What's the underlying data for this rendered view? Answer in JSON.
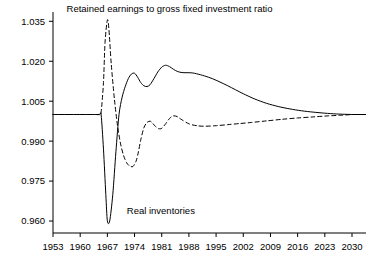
{
  "chart_data": {
    "type": "line",
    "title": "",
    "xlabel": "",
    "ylabel": "",
    "xlim": [
      1953,
      2030
    ],
    "ylim": [
      0.9555,
      1.0385
    ],
    "grid": false,
    "legend_position": "inline-annotation",
    "xticks": [
      "1953",
      "1960",
      "1967",
      "1974",
      "1981",
      "1988",
      "1995",
      "2002",
      "2009",
      "2016",
      "2023",
      "2030"
    ],
    "xtick_values": [
      1953,
      1960,
      1967,
      1974,
      1981,
      1988,
      1995,
      2002,
      2009,
      2016,
      2023,
      2030
    ],
    "yticks": [
      "0.960",
      "0.975",
      "0.990",
      "1.005",
      "1.020",
      "1.035"
    ],
    "ytick_values": [
      0.96,
      0.975,
      0.99,
      1.005,
      1.02,
      1.035
    ],
    "annotations": [
      {
        "name": "retained-earnings-label",
        "text": "Retained earnings to gross fixed investment ratio",
        "x": 1983,
        "y": 1.0385
      },
      {
        "name": "real-inventories-label",
        "text": "Real inventories",
        "x": 1972,
        "y": 0.9625
      }
    ],
    "series": [
      {
        "name": "Real inventories",
        "style": "solid",
        "color": "#000000",
        "x": [
          1953,
          1956,
          1959,
          1962,
          1964,
          1965,
          1965.4,
          1966,
          1966.6,
          1967,
          1967.6,
          1968.4,
          1969.2,
          1970,
          1970.8,
          1971.6,
          1972.4,
          1973.2,
          1974,
          1974.8,
          1975.6,
          1976.4,
          1977.2,
          1978,
          1979,
          1980,
          1981,
          1982,
          1983,
          1984,
          1985,
          1986,
          1987,
          1988,
          1989,
          1990,
          1992,
          1994,
          1996,
          1998,
          2000,
          2002,
          2005,
          2008,
          2011,
          2014,
          2017,
          2020,
          2023,
          2026,
          2030
        ],
        "y": [
          1.0,
          1.0,
          1.0,
          1.0,
          1.0,
          1.0,
          0.9998,
          0.987,
          0.97,
          0.9601,
          0.96,
          0.97,
          0.986,
          1.0,
          1.0065,
          1.0105,
          1.0135,
          1.0152,
          1.0155,
          1.014,
          1.012,
          1.0108,
          1.0105,
          1.0112,
          1.0135,
          1.016,
          1.0178,
          1.0185,
          1.018,
          1.017,
          1.0162,
          1.0158,
          1.0157,
          1.0157,
          1.0156,
          1.0153,
          1.0145,
          1.0135,
          1.0122,
          1.0108,
          1.0093,
          1.0078,
          1.0058,
          1.0042,
          1.003,
          1.0021,
          1.0014,
          1.0009,
          1.0005,
          1.0002,
          1.0
        ]
      },
      {
        "name": "Retained earnings to gross fixed investment ratio",
        "style": "dashed",
        "color": "#000000",
        "x": [
          1953,
          1956,
          1959,
          1962,
          1964,
          1965,
          1965.4,
          1966,
          1966.4,
          1967,
          1967.4,
          1968,
          1968.8,
          1969.6,
          1970.4,
          1971.2,
          1972,
          1972.8,
          1973.6,
          1974.4,
          1975,
          1975.6,
          1976.4,
          1977.2,
          1978,
          1978.6,
          1979.4,
          1980.2,
          1981,
          1982,
          1983,
          1984,
          1985,
          1986,
          1988,
          1990,
          1992,
          1995,
          1998,
          2001,
          2004,
          2008,
          2012,
          2016,
          2020,
          2024,
          2027,
          2030
        ],
        "y": [
          1.0,
          1.0,
          1.0,
          1.0,
          1.0,
          1.0,
          1.001,
          1.012,
          1.027,
          1.0355,
          1.032,
          1.019,
          1.006,
          0.996,
          0.989,
          0.9845,
          0.9818,
          0.9806,
          0.9805,
          0.9825,
          0.986,
          0.9905,
          0.995,
          0.997,
          0.9975,
          0.9968,
          0.9955,
          0.9947,
          0.9948,
          0.9965,
          0.9985,
          0.9995,
          0.9992,
          0.9982,
          0.9965,
          0.9958,
          0.9956,
          0.9958,
          0.9962,
          0.9966,
          0.997,
          0.9976,
          0.9982,
          0.9987,
          0.9991,
          0.9995,
          0.9997,
          1.0
        ]
      }
    ]
  },
  "axis": {
    "tick_color": "#000000",
    "axis_color": "#000000"
  }
}
